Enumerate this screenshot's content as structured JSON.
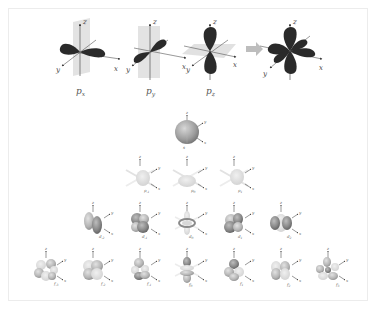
{
  "top_row": {
    "orbitals": [
      {
        "name": "px",
        "label": "p",
        "sub": "x"
      },
      {
        "name": "py",
        "label": "p",
        "sub": "y"
      },
      {
        "name": "pz",
        "label": "p",
        "sub": "z"
      }
    ],
    "combined_label": "",
    "arrow": "combine-arrow",
    "axes": {
      "x": "x",
      "y": "y",
      "z": "z"
    }
  },
  "pyramid": {
    "rows": [
      {
        "name": "s",
        "items": [
          {
            "label": "s",
            "sub": ""
          }
        ]
      },
      {
        "name": "p",
        "items": [
          {
            "label": "p",
            "sub": "-1"
          },
          {
            "label": "p",
            "sub": "0"
          },
          {
            "label": "p",
            "sub": "1"
          }
        ]
      },
      {
        "name": "d",
        "items": [
          {
            "label": "d",
            "sub": "-2"
          },
          {
            "label": "d",
            "sub": "-1"
          },
          {
            "label": "d",
            "sub": "0"
          },
          {
            "label": "d",
            "sub": "1"
          },
          {
            "label": "d",
            "sub": "2"
          }
        ]
      },
      {
        "name": "f",
        "items": [
          {
            "label": "f",
            "sub": "-3"
          },
          {
            "label": "f",
            "sub": "-2"
          },
          {
            "label": "f",
            "sub": "-1"
          },
          {
            "label": "f",
            "sub": "0"
          },
          {
            "label": "f",
            "sub": "1"
          },
          {
            "label": "f",
            "sub": "2"
          },
          {
            "label": "f",
            "sub": "3"
          }
        ]
      }
    ],
    "axes": {
      "x": "x",
      "y": "y",
      "z": "z"
    }
  },
  "colors": {
    "lobe_dark": "#2a2a2a",
    "plane": "#d8d8d8",
    "arrow": "#bdbdbd",
    "orbital_gray": "#9a9a9a",
    "frame": "#ececec"
  }
}
